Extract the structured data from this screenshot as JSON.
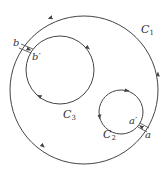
{
  "diagram": {
    "type": "contour-integration-cuts",
    "colors": {
      "stroke": "#444444",
      "text": "#333333",
      "background": "#ffffff"
    },
    "contours": [
      {
        "id": "C1",
        "label": "C",
        "subscript": "1",
        "cx": 84,
        "cy": 90,
        "r": 74,
        "orientation": "counterclockwise"
      },
      {
        "id": "C2",
        "label": "C",
        "subscript": "2",
        "cx": 121,
        "cy": 112,
        "r": 22,
        "orientation": "clockwise"
      },
      {
        "id": "C3",
        "label": "C",
        "subscript": "3",
        "cx": 60,
        "cy": 70,
        "r": 34,
        "orientation": "clockwise"
      }
    ],
    "points": [
      {
        "id": "a",
        "label": "a"
      },
      {
        "id": "a_prime",
        "label": "a′"
      },
      {
        "id": "b",
        "label": "b"
      },
      {
        "id": "b_prime",
        "label": "b′"
      }
    ]
  }
}
